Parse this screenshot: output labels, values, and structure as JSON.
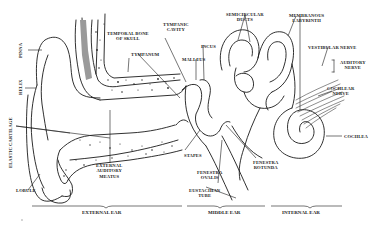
{
  "diagram": {
    "labels": {
      "pinna": "PINNA",
      "helix": "HELIX",
      "elastic_cartilage": "ELASTIC CARTILAGE",
      "lobule": "LOBULE",
      "temporal_bone": [
        "TEMPORAL BONE",
        "OF SKULL"
      ],
      "tympanum": "TYMPANUM",
      "tympanic_cavity": [
        "TYMPANIC",
        "CAVITY"
      ],
      "malleus": "MALLEUS",
      "incus": "INCUS",
      "stapes": "STAPES",
      "semicircular_ducts": [
        "SEMICIRCULAR",
        "DUCTS"
      ],
      "membranous_labyrinth": [
        "MEMBRANOUS",
        "LABYRINTH"
      ],
      "vestibular_nerve": "VESTIBULAR NERVE",
      "auditory_nerve": [
        "AUDITORY",
        "NERVE"
      ],
      "cochlear_nerve": [
        "COCHLEAR",
        "NERVE"
      ],
      "cochlea": "COCHLEA",
      "external_auditory_meatus": [
        "EXTERNAL",
        "AUDITORY",
        "MEATUS"
      ],
      "fenestra_ovalis": [
        "FENESTRA",
        "OVALIS"
      ],
      "fenestra_rotunda": [
        "FENESTRA",
        "ROTUNDA"
      ],
      "eustachian_tube": [
        "EUSTACHIAN",
        "TUBE"
      ]
    },
    "sections": {
      "external": "EXTERNAL EAR",
      "middle": "MIDDLE EAR",
      "internal": "INTERNAL EAR"
    }
  }
}
